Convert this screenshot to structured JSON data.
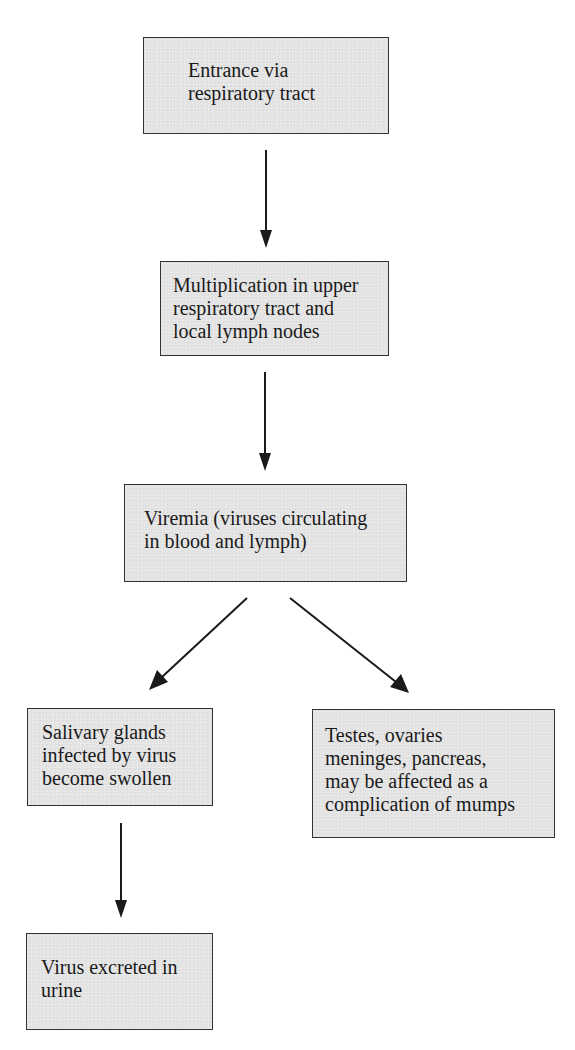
{
  "diagram": {
    "type": "flowchart",
    "nodes": [
      {
        "id": "entrance",
        "lines": [
          "Entrance via",
          "respiratory tract"
        ]
      },
      {
        "id": "multiplication",
        "lines": [
          "Multiplication in upper",
          "respiratory tract and",
          "local lymph nodes"
        ]
      },
      {
        "id": "viremia",
        "lines": [
          "Viremia (viruses circulating",
          "in blood and lymph)"
        ]
      },
      {
        "id": "salivary",
        "lines": [
          "Salivary glands",
          "infected by virus",
          "become swollen"
        ]
      },
      {
        "id": "complications",
        "lines": [
          "Testes, ovaries",
          "meninges, pancreas,",
          "may be affected as a",
          "complication of mumps"
        ]
      },
      {
        "id": "excreted",
        "lines": [
          "Virus excreted in",
          "urine"
        ]
      }
    ],
    "edges": [
      {
        "from": "entrance",
        "to": "multiplication"
      },
      {
        "from": "multiplication",
        "to": "viremia"
      },
      {
        "from": "viremia",
        "to": "salivary"
      },
      {
        "from": "viremia",
        "to": "complications"
      },
      {
        "from": "salivary",
        "to": "excreted"
      }
    ],
    "colors": {
      "box_fill": "#e4e4e4",
      "box_border": "#333333",
      "arrow": "#1a1a1a",
      "text": "#1a1a1a"
    }
  }
}
